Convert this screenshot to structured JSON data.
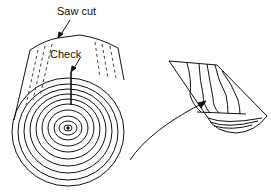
{
  "diagram": {
    "labels": {
      "saw_cut": "Saw cut",
      "check": "Check"
    },
    "elements": [
      {
        "name": "log",
        "description": "cylindrical log with growth rings on end grain and a radial check"
      },
      {
        "name": "board",
        "description": "board cut from log showing grain pattern"
      },
      {
        "name": "arrow",
        "description": "curved arrow from log to board"
      }
    ],
    "colors": {
      "ink": "#111111",
      "background": "#ffffff"
    }
  }
}
